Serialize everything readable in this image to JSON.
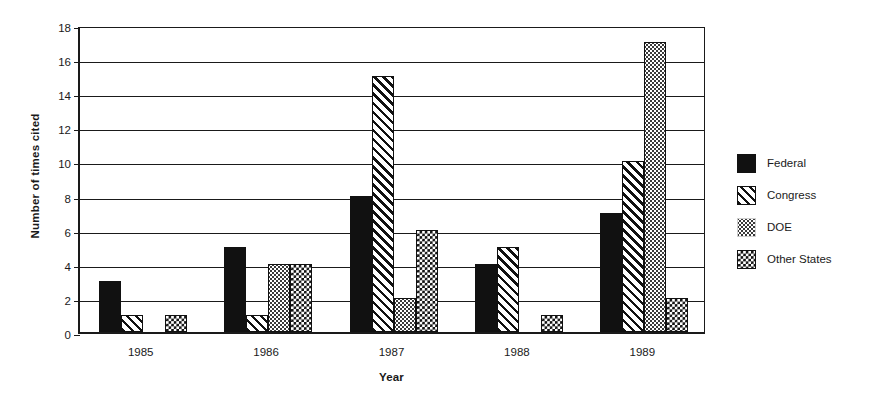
{
  "chart_data": {
    "type": "bar",
    "title": "",
    "xlabel": "Year",
    "ylabel": "Number of times cited",
    "categories": [
      "1985",
      "1986",
      "1987",
      "1988",
      "1989"
    ],
    "ylim": [
      0,
      18
    ],
    "ytick_labels": [
      "0",
      "2",
      "4",
      "6",
      "8",
      "10",
      "12",
      "14",
      "16",
      "18"
    ],
    "ytick_values": [
      0,
      2,
      4,
      6,
      8,
      10,
      12,
      14,
      16,
      18
    ],
    "grid": "horizontal",
    "legend_position": "right",
    "series": [
      {
        "name": "Federal",
        "pattern": "solid",
        "values": [
          3,
          5,
          8,
          4,
          7
        ]
      },
      {
        "name": "Congress",
        "pattern": "hatch",
        "values": [
          1,
          1,
          15,
          5,
          10
        ]
      },
      {
        "name": "DOE",
        "pattern": "dots",
        "values": [
          0,
          4,
          2,
          0,
          17
        ]
      },
      {
        "name": "Other States",
        "pattern": "check",
        "values": [
          1,
          4,
          6,
          1,
          2
        ]
      }
    ]
  },
  "legend": {
    "items": [
      {
        "label": "Federal",
        "pattern": "solid"
      },
      {
        "label": "Congress",
        "pattern": "hatch"
      },
      {
        "label": "DOE",
        "pattern": "dots"
      },
      {
        "label": "Other States",
        "pattern": "check"
      }
    ]
  },
  "colors": {
    "ink": "#111111",
    "background": "#ffffff"
  }
}
